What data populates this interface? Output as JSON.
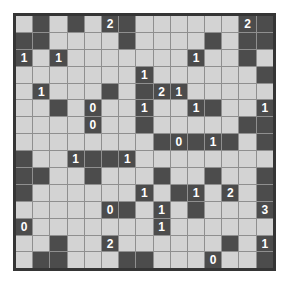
{
  "puzzle": {
    "type_label": "light-up-akari-grid",
    "rows": 15,
    "cols": 15,
    "cells": [
      ".#.#.2#......2#",
      "##....#....#.##",
      "1.1.......1..#.",
      ".......1......#",
      ".1...#.#21.....",
      "..#.0..1..1#..1",
      "....0..#.....##",
      "........#0#1#.#",
      "#..1##1........",
      "##..#...#..#..#",
      "#......1.#1.2.#",
      ".....0#.1.#...3",
      "0.......1......",
      "..#..2......#.1",
      ".##...##...0..#"
    ],
    "clue_values": [
      "0",
      "1",
      "2",
      "3"
    ],
    "colors": {
      "light_cell": "#d3d3d3",
      "dark_cell": "#4c4c4c",
      "grid_line": "#8f8f8f",
      "border": "#353535",
      "number": "#ffffff",
      "background": "#ffffff"
    }
  }
}
